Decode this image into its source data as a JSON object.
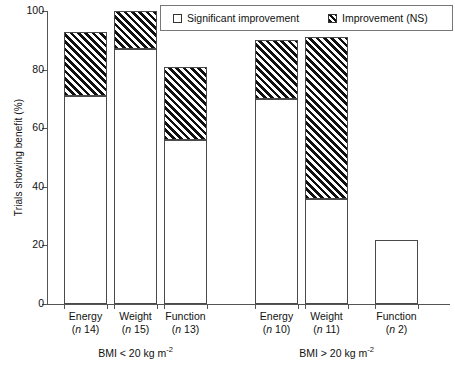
{
  "chart_data": {
    "type": "bar",
    "stacked": true,
    "title": "",
    "xlabel": "",
    "ylabel": "Trials showing benefit (%)",
    "ylim": [
      0,
      100
    ],
    "yticks": [
      0,
      20,
      40,
      60,
      80,
      100
    ],
    "grid": false,
    "legend_position": "top-right",
    "categories": [
      "Energy (n 14)",
      "Weight (n 15)",
      "Function (n 13)",
      "Energy (n 10)",
      "Weight (n 11)",
      "Function (n 2)"
    ],
    "series": [
      {
        "name": "Significant improvement",
        "fill": "white",
        "values": [
          71,
          87,
          56,
          70,
          36,
          22
        ]
      },
      {
        "name": "Improvement (NS)",
        "fill": "hatched",
        "values": [
          22,
          13,
          25,
          20,
          55,
          0
        ]
      }
    ],
    "totals": [
      93,
      100,
      81,
      90,
      91,
      22
    ],
    "groups": [
      {
        "label": "BMI < 20 kg m-2",
        "categories": [
          0,
          1,
          2
        ]
      },
      {
        "label": "BMI > 20 kg m-2",
        "categories": [
          3,
          4,
          5
        ]
      }
    ]
  },
  "axes": {
    "y_title": "Trials showing benefit (%)",
    "y_ticks": [
      {
        "value": 100,
        "label": "100"
      },
      {
        "value": 80,
        "label": "80"
      },
      {
        "value": 60,
        "label": "60"
      },
      {
        "value": 40,
        "label": "40"
      },
      {
        "value": 20,
        "label": "20"
      },
      {
        "value": 0,
        "label": "0"
      }
    ]
  },
  "legend": {
    "items": [
      {
        "label": "Significant improvement",
        "swatch": "open-square-icon"
      },
      {
        "label": "Improvement (NS)",
        "swatch": "hatched-square-icon"
      }
    ]
  },
  "bars": [
    {
      "name": "Energy",
      "n_prefix": "n",
      "n": "14",
      "n_label": "(n 14)",
      "significant": 71,
      "ns": 22,
      "total": 93
    },
    {
      "name": "Weight",
      "n_prefix": "n",
      "n": "15",
      "n_label": "(n 15)",
      "significant": 87,
      "ns": 13,
      "total": 100
    },
    {
      "name": "Function",
      "n_prefix": "n",
      "n": "13",
      "n_label": "(n 13)",
      "significant": 56,
      "ns": 25,
      "total": 81
    },
    {
      "name": "Energy",
      "n_prefix": "n",
      "n": "10",
      "n_label": "(n 10)",
      "significant": 70,
      "ns": 20,
      "total": 90
    },
    {
      "name": "Weight",
      "n_prefix": "n",
      "n": "11",
      "n_label": "(n 11)",
      "significant": 36,
      "ns": 55,
      "total": 91
    },
    {
      "name": "Function",
      "n_prefix": "n",
      "n": "2",
      "n_label": "(n 2)",
      "significant": 22,
      "ns": 0,
      "total": 22
    }
  ],
  "groups": [
    {
      "prefix": "BMI < 20 kg m",
      "exponent": "-2"
    },
    {
      "prefix": "BMI > 20 kg m",
      "exponent": "-2"
    }
  ]
}
